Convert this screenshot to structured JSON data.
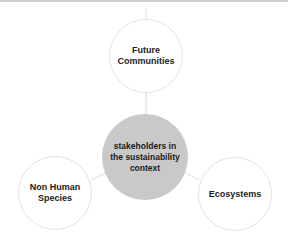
{
  "diagram": {
    "center": {
      "label": "stakeholders in the sustainability context",
      "fill": "#c9c9c9"
    },
    "nodes": [
      {
        "id": "top",
        "label": "Future Communities"
      },
      {
        "id": "left",
        "label": "Non Human Species"
      },
      {
        "id": "right",
        "label": "Ecosystems"
      }
    ],
    "colors": {
      "outer_border": "#e3e3e3",
      "connector": "#dcdcdc",
      "text": "#222222"
    }
  }
}
